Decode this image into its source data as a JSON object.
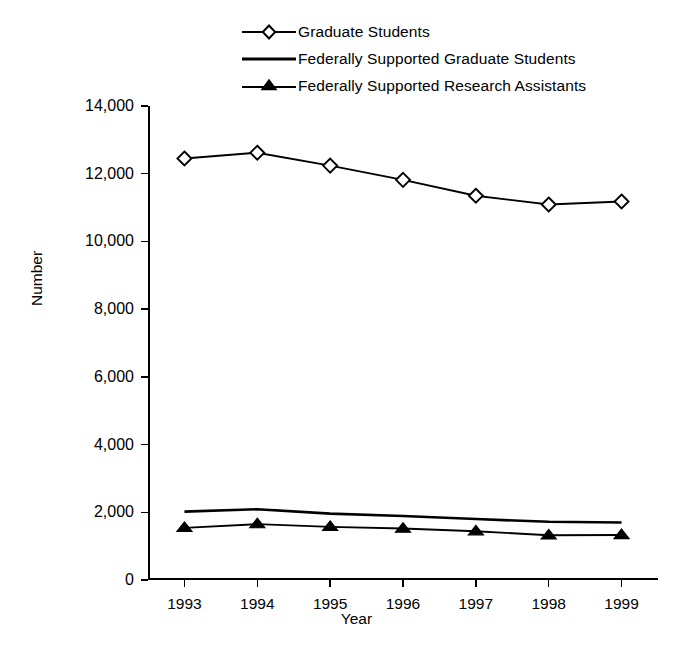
{
  "chart_data": {
    "type": "line",
    "title": "",
    "xlabel": "Year",
    "ylabel": "Number",
    "categories": [
      "1993",
      "1994",
      "1995",
      "1996",
      "1997",
      "1998",
      "1999"
    ],
    "x": [
      1993,
      1994,
      1995,
      1996,
      1997,
      1998,
      1999
    ],
    "ylim": [
      0,
      14000
    ],
    "yticks": [
      0,
      2000,
      4000,
      6000,
      8000,
      10000,
      12000,
      14000
    ],
    "ytick_labels": [
      "0",
      "2,000",
      "4,000",
      "6,000",
      "8,000",
      "10,000",
      "12,000",
      "14,000"
    ],
    "grid": false,
    "legend_position": "top-center",
    "series": [
      {
        "name": "Graduate Students",
        "marker": "open-diamond",
        "values": [
          12450,
          12620,
          12240,
          11820,
          11350,
          11090,
          11180
        ]
      },
      {
        "name": "Federally Supported Graduate Students",
        "marker": "none",
        "values": [
          2020,
          2090,
          1960,
          1890,
          1800,
          1720,
          1700
        ]
      },
      {
        "name": "Federally Supported Research Assistants",
        "marker": "filled-triangle",
        "values": [
          1540,
          1650,
          1570,
          1520,
          1440,
          1320,
          1330
        ]
      }
    ]
  },
  "legend": {
    "entries": [
      {
        "label": "Graduate Students",
        "marker": "open-diamond"
      },
      {
        "label": "Federally Supported Graduate Students",
        "marker": "line"
      },
      {
        "label": "Federally Supported Research Assistants",
        "marker": "filled-triangle"
      }
    ]
  },
  "colors": {
    "line": "#000000",
    "axis": "#000000",
    "background": "#ffffff",
    "marker_fill": "#ffffff"
  }
}
